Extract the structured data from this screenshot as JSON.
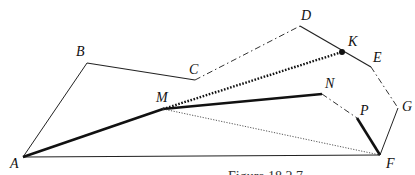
{
  "figure": {
    "caption": "Figure 18.2.7",
    "points": {
      "A": {
        "label": "A",
        "x": 23,
        "y": 157,
        "lx": 10,
        "ly": 168
      },
      "B": {
        "label": "B",
        "x": 87,
        "y": 63,
        "lx": 76,
        "ly": 56
      },
      "C": {
        "label": "C",
        "x": 195,
        "y": 80,
        "lx": 189,
        "ly": 74
      },
      "D": {
        "label": "D",
        "x": 300,
        "y": 26,
        "lx": 301,
        "ly": 20
      },
      "K": {
        "label": "K",
        "x": 342,
        "y": 52,
        "lx": 348,
        "ly": 46
      },
      "E": {
        "label": "E",
        "x": 371,
        "y": 67,
        "lx": 373,
        "ly": 62
      },
      "G": {
        "label": "G",
        "x": 398,
        "y": 108,
        "lx": 402,
        "ly": 111
      },
      "F": {
        "label": "F",
        "x": 380,
        "y": 155,
        "lx": 386,
        "ly": 168
      },
      "M": {
        "label": "M",
        "x": 163,
        "y": 109,
        "lx": 156,
        "ly": 102
      },
      "N": {
        "label": "N",
        "x": 322,
        "y": 94,
        "lx": 325,
        "ly": 88
      },
      "P": {
        "label": "P",
        "x": 357,
        "y": 118,
        "lx": 360,
        "ly": 115
      }
    }
  }
}
